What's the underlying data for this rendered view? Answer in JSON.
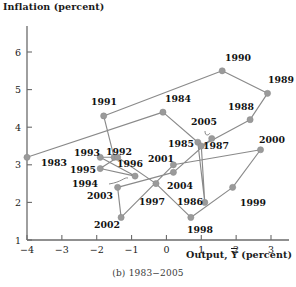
{
  "figure": {
    "caption": "(b) 1983−2005",
    "y_axis_title": "Inflation (percent)",
    "x_axis_title_prefix": "Output, ",
    "x_axis_title_var": "Y",
    "x_axis_title_suffix": " (percent)",
    "marker_color": "#9a9a9a",
    "line_color": "#8a8a8a",
    "axis_color": "#6b6b6b",
    "text_color": "#111111"
  },
  "chart_data": {
    "type": "scatter",
    "title": "(b) 1983−2005",
    "xlabel": "Output, Ỹ (percent)",
    "ylabel": "Inflation (percent)",
    "xlim": [
      -4,
      3
    ],
    "ylim": [
      1,
      6
    ],
    "xticks": [
      -4,
      -3,
      -2,
      -1,
      0,
      1,
      2,
      3
    ],
    "xticklabels": [
      "−4",
      "−3",
      "−2",
      "−1",
      "0",
      "1",
      "2",
      "3"
    ],
    "yticks": [
      1,
      2,
      3,
      4,
      5,
      6
    ],
    "yticklabels": [
      "1",
      "2",
      "3",
      "4",
      "5",
      "6"
    ],
    "grid": false,
    "legend": null,
    "connected": true,
    "series": [
      {
        "name": "Output gap vs inflation, 1983–2005",
        "points": [
          {
            "label": "1983",
            "x": -4.0,
            "y": 3.2
          },
          {
            "label": "1984",
            "x": -0.1,
            "y": 4.4
          },
          {
            "label": "1985",
            "x": 0.9,
            "y": 3.6
          },
          {
            "label": "1986",
            "x": 1.1,
            "y": 2.0
          },
          {
            "label": "1987",
            "x": 1.0,
            "y": 3.5
          },
          {
            "label": "1988",
            "x": 2.4,
            "y": 4.2
          },
          {
            "label": "1989",
            "x": 2.9,
            "y": 4.9
          },
          {
            "label": "1990",
            "x": 1.6,
            "y": 5.5
          },
          {
            "label": "1991",
            "x": -1.8,
            "y": 4.3
          },
          {
            "label": "1992",
            "x": -1.5,
            "y": 3.2
          },
          {
            "label": "1993",
            "x": -1.9,
            "y": 3.2
          },
          {
            "label": "1994",
            "x": -0.9,
            "y": 2.7
          },
          {
            "label": "1995",
            "x": -1.9,
            "y": 2.9
          },
          {
            "label": "1996",
            "x": -1.4,
            "y": 3.2
          },
          {
            "label": "1997",
            "x": -0.3,
            "y": 2.5
          },
          {
            "label": "1998",
            "x": 0.7,
            "y": 1.6
          },
          {
            "label": "1999",
            "x": 1.9,
            "y": 2.4
          },
          {
            "label": "2000",
            "x": 2.7,
            "y": 3.4
          },
          {
            "label": "2001",
            "x": 0.2,
            "y": 3.0
          },
          {
            "label": "2002",
            "x": -1.3,
            "y": 1.6
          },
          {
            "label": "2003",
            "x": -1.4,
            "y": 2.4
          },
          {
            "label": "2004",
            "x": 0.2,
            "y": 2.8
          },
          {
            "label": "2005",
            "x": 1.3,
            "y": 3.7
          }
        ]
      }
    ]
  },
  "point_labels": {
    "1983": {
      "x": 41,
      "y": 166,
      "anchor": "start"
    },
    "1991": {
      "x": 104,
      "y": 105,
      "anchor": "middle"
    },
    "1984": {
      "x": 178,
      "y": 102,
      "anchor": "middle"
    },
    "1990": {
      "x": 238,
      "y": 61,
      "anchor": "middle"
    },
    "1989": {
      "x": 281,
      "y": 83,
      "anchor": "middle"
    },
    "1988": {
      "x": 241,
      "y": 110,
      "anchor": "middle"
    },
    "2005": {
      "x": 204,
      "y": 125,
      "anchor": "middle"
    },
    "1985": {
      "x": 181,
      "y": 147,
      "anchor": "middle"
    },
    "1987": {
      "x": 216,
      "y": 149,
      "anchor": "middle"
    },
    "2000": {
      "x": 272,
      "y": 143,
      "anchor": "middle"
    },
    "1993": {
      "x": 87,
      "y": 156,
      "anchor": "middle"
    },
    "1992": {
      "x": 119,
      "y": 155,
      "anchor": "middle"
    },
    "1996": {
      "x": 130,
      "y": 167,
      "anchor": "middle"
    },
    "2001": {
      "x": 161,
      "y": 162,
      "anchor": "middle"
    },
    "1995": {
      "x": 83,
      "y": 173,
      "anchor": "middle"
    },
    "1994": {
      "x": 85,
      "y": 187,
      "anchor": "middle"
    },
    "2004": {
      "x": 180,
      "y": 189,
      "anchor": "middle"
    },
    "2003": {
      "x": 100,
      "y": 199,
      "anchor": "middle"
    },
    "1997": {
      "x": 152,
      "y": 205,
      "anchor": "middle"
    },
    "1999": {
      "x": 253,
      "y": 206,
      "anchor": "middle"
    },
    "1986": {
      "x": 190,
      "y": 205,
      "anchor": "middle"
    },
    "2002": {
      "x": 107,
      "y": 228,
      "anchor": "middle"
    },
    "1998": {
      "x": 200,
      "y": 233,
      "anchor": "middle"
    }
  }
}
